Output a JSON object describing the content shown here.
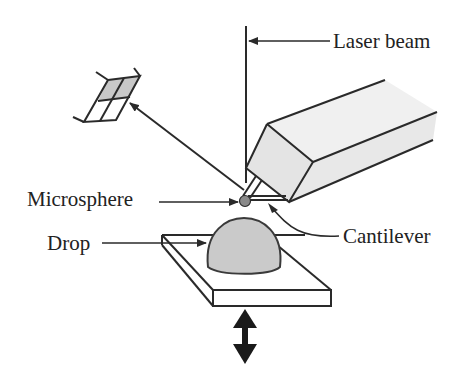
{
  "diagram": {
    "labels": {
      "laser_beam": "Laser beam",
      "microsphere": "Microsphere",
      "cantilever": "Cantilever",
      "drop": "Drop"
    },
    "components": [
      {
        "name": "laser-beam",
        "description": "vertical incident laser line"
      },
      {
        "name": "photodetector",
        "description": "segmented photodiode (upper-left), reflected beam arrow pointing to it"
      },
      {
        "name": "cantilever-holder",
        "description": "rectangular prism holder at upper right"
      },
      {
        "name": "cantilever",
        "description": "V-shaped cantilever with microsphere at tip"
      },
      {
        "name": "microsphere",
        "description": "small grey sphere at cantilever tip"
      },
      {
        "name": "drop",
        "description": "grey hemispherical drop on substrate"
      },
      {
        "name": "substrate",
        "description": "flat plate under the drop"
      },
      {
        "name": "piezo-motion-arrow",
        "description": "double-headed vertical arrow below substrate"
      }
    ],
    "colors": {
      "line": "#2a2a2a",
      "fill_grey": "#c8c8c8",
      "holder_fill": "#ededed",
      "sphere": "#888888",
      "background": "#ffffff"
    }
  }
}
